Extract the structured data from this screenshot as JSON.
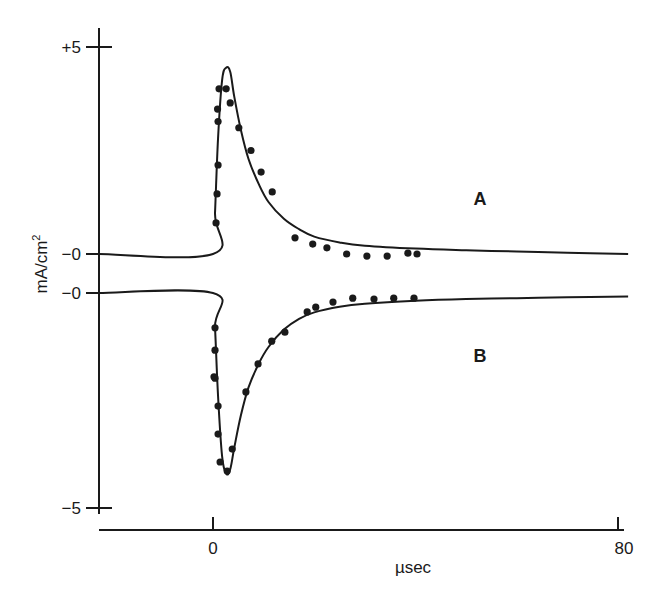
{
  "chart_data": {
    "type": "line",
    "title": "",
    "xlabel": "µsec",
    "ylabel": "mA/cm²",
    "xlim": [
      -22.5,
      82
    ],
    "x_ticks": [
      {
        "value": 0,
        "label": "0"
      },
      {
        "value": 80,
        "label": "80"
      }
    ],
    "y_ticks": [
      {
        "value": 5,
        "label": "+5",
        "series": "A"
      },
      {
        "value": 0,
        "label": "−0",
        "series": "A"
      },
      {
        "value": 0,
        "label": "−0",
        "series": "B"
      },
      {
        "value": -5,
        "label": "−5",
        "series": "B"
      }
    ],
    "grid": false,
    "legend": "inline labels",
    "series": [
      {
        "name": "A",
        "label": "A",
        "kind": "theoretical curve (line) with experimental points (dots)",
        "zero_offset_px": 254,
        "curve": {
          "x": [
            -22.5,
            0,
            0.4,
            1.0,
            1.8,
            2.6,
            3.4,
            4.2,
            5.5,
            7,
            9,
            11,
            14,
            17,
            20,
            25,
            30,
            40,
            50,
            60,
            70,
            82
          ],
          "y": [
            0,
            0,
            1.0,
            2.8,
            4.2,
            4.5,
            4.4,
            3.8,
            3.0,
            2.3,
            1.7,
            1.25,
            0.85,
            0.6,
            0.42,
            0.28,
            0.2,
            0.13,
            0.09,
            0.06,
            0.03,
            0.0
          ]
        },
        "points": {
          "x": [
            0.6,
            0.8,
            1.0,
            1.0,
            0.9,
            1.2,
            2.6,
            3.4,
            5.1,
            7.5,
            9.5,
            11.7,
            16.2,
            19.7,
            22.5,
            26.4,
            30.4,
            34.4,
            38.5,
            40.3
          ],
          "y": [
            0.75,
            1.45,
            2.15,
            3.2,
            3.5,
            3.99,
            3.99,
            3.65,
            3.05,
            2.5,
            1.98,
            1.5,
            0.39,
            0.24,
            0.15,
            0.0,
            -0.05,
            -0.05,
            0.02,
            0.0
          ]
        }
      },
      {
        "name": "B",
        "label": "B",
        "kind": "theoretical curve (line) with experimental points (dots)",
        "zero_offset_px": 293,
        "curve": {
          "x": [
            -22.5,
            0,
            0.4,
            1.0,
            1.8,
            2.6,
            3.4,
            4.2,
            5.5,
            7,
            9,
            11,
            14,
            17,
            20,
            25,
            30,
            40,
            50,
            60,
            70,
            82
          ],
          "y": [
            0,
            0,
            -0.8,
            -2.4,
            -3.8,
            -4.2,
            -4.1,
            -3.6,
            -2.85,
            -2.2,
            -1.65,
            -1.25,
            -0.85,
            -0.6,
            -0.45,
            -0.32,
            -0.25,
            -0.18,
            -0.14,
            -0.12,
            -0.1,
            -0.08
          ]
        },
        "points": {
          "x": [
            0.4,
            0.4,
            0.4,
            0.2,
            1.0,
            1.0,
            1.4,
            2.8,
            3.8,
            6.5,
            8.9,
            11.6,
            14.2,
            18.6,
            20.3,
            23.7,
            27.6,
            31.8,
            35.7,
            39.7
          ],
          "y": [
            -0.81,
            -1.33,
            -1.98,
            -1.95,
            -2.63,
            -3.28,
            -3.93,
            -4.14,
            -3.63,
            -2.3,
            -1.65,
            -1.12,
            -0.91,
            -0.44,
            -0.33,
            -0.21,
            -0.12,
            -0.14,
            -0.12,
            -0.12
          ]
        }
      }
    ]
  },
  "labels": {
    "y_top": "+5",
    "y_zero_a": "−0",
    "y_zero_b": "−0",
    "y_bottom": "−5",
    "x_zero": "0",
    "x_end": "80",
    "x_title": "µsec",
    "y_title": "mA/cm",
    "y_title_sup": "2",
    "series_a": "A",
    "series_b": "B"
  },
  "colors": {
    "ink": "#1a1a1a",
    "background": "#ffffff"
  }
}
